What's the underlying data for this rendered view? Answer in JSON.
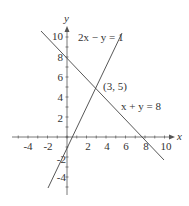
{
  "chart_data": {
    "type": "line",
    "title": "",
    "xlabel": "x",
    "ylabel": "y",
    "xlim": [
      -5,
      11
    ],
    "ylim": [
      -5.5,
      11
    ],
    "x_ticks": [
      "-4",
      "-2",
      "2",
      "4",
      "6",
      "8",
      "10"
    ],
    "y_ticks": [
      "10",
      "8",
      "6",
      "4",
      "2",
      "-2",
      "-4"
    ],
    "grid": false,
    "series": [
      {
        "name": "2x − y = 1",
        "x": [
          -1.9,
          5.6
        ],
        "y": [
          -4.8,
          10.2
        ]
      },
      {
        "name": "x + y = 8",
        "x": [
          -2.6,
          10.0
        ],
        "y": [
          10.6,
          -2.0
        ]
      }
    ],
    "annotations": [
      {
        "text": "(3, 5)",
        "x": 3,
        "y": 5
      },
      {
        "text": "2x − y = 1",
        "x": 3.5,
        "y": 10
      },
      {
        "text": "x + y = 8",
        "x": 7,
        "y": 3
      }
    ],
    "intersection": {
      "x": 3,
      "y": 5,
      "label": "(3, 5)"
    }
  },
  "labels": {
    "x_axis": "x",
    "y_axis": "y",
    "eq1": "2x − y = 1",
    "eq2": "x + y = 8",
    "point": "(3, 5)"
  }
}
